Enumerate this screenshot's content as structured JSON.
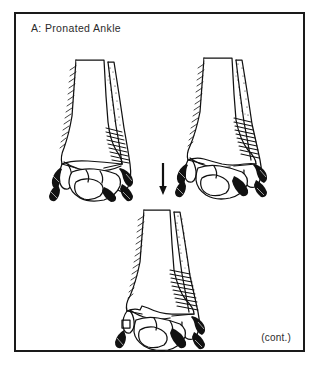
{
  "page": {
    "background_color": "#ffffff",
    "header_fragment": "",
    "width": 320,
    "height": 366
  },
  "figure": {
    "title": "A: Pronated Ankle",
    "continuation_label": "(cont.)",
    "border_color": "#1a1a1a",
    "ink_color": "#111111",
    "fill_color": "#ffffff",
    "panels": [
      {
        "id": "ankle-figure-1",
        "name": "pronated-ankle-stage-1",
        "view": "anterior",
        "description": "Anterior view of right ankle mortise: distal tibia, distal fibula with oblique stippled fracture line, talus, with dark ligament attachments medially and laterally."
      },
      {
        "id": "ankle-figure-2",
        "name": "pronated-ankle-stage-2",
        "view": "anterior",
        "description": "Anterior view of ankle showing progression: widened medial clear space, fibular fracture comminution and disrupted deltoid ligament."
      },
      {
        "id": "ankle-figure-3",
        "name": "pronated-ankle-stage-3",
        "view": "anterior",
        "description": "Anterior view of ankle with complete disruption: displaced fibular fracture, talar shift and avulsed medial malleolus fragment."
      }
    ],
    "arrow": {
      "name": "progression-arrow",
      "direction": "down"
    }
  }
}
